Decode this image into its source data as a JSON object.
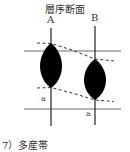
{
  "diagram": {
    "title": "層序断面",
    "columns": [
      {
        "label": "A",
        "x": 51
      },
      {
        "label": "B",
        "x": 95
      }
    ],
    "horizon_labels": [
      "a",
      "a"
    ],
    "caption": "7）多産帯",
    "colors": {
      "line": "#222222",
      "lens_fill": "#000000",
      "dash": "#333333",
      "background": "#ffffff"
    }
  }
}
